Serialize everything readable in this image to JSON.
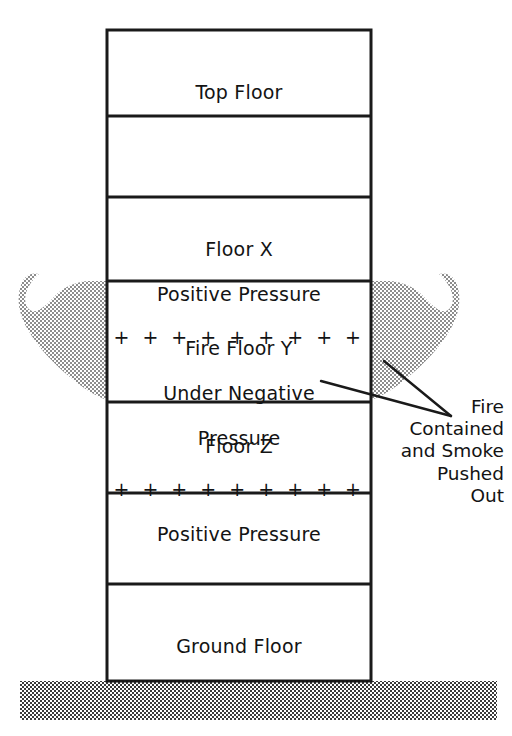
{
  "diagram": {
    "colors": {
      "line": "#1a1a1a",
      "text": "#131313",
      "background": "#ffffff",
      "smoke_fill": "#9a9a9a",
      "ground_fill": "#4d4d4d"
    }
  },
  "building": {
    "floors": [
      {
        "id": "top-floor",
        "lines": [
          "Top Floor"
        ],
        "has_plus_row": false,
        "plus_row_index": null
      },
      {
        "id": "blank-floor-upper",
        "lines": [],
        "has_plus_row": false,
        "plus_row_index": null
      },
      {
        "id": "floor-x",
        "lines": [
          "Floor X",
          "Positive Pressure"
        ],
        "has_plus_row": true,
        "plus_row_index": 2,
        "plus_signs": "+ + + + + + + + +",
        "plus_count": 9
      },
      {
        "id": "fire-floor-y",
        "lines": [
          "Fire Floor Y",
          "Under Negative",
          "Pressure"
        ],
        "has_plus_row": false,
        "plus_row_index": null
      },
      {
        "id": "floor-z",
        "lines": [
          "Floor Z",
          "Positive Pressure"
        ],
        "has_plus_row": true,
        "plus_row_index": 1,
        "plus_signs": "+ + + + + + + + +",
        "plus_count": 9
      },
      {
        "id": "blank-floor-lower",
        "lines": [],
        "has_plus_row": false,
        "plus_row_index": null
      },
      {
        "id": "ground-floor",
        "lines": [
          "Ground Floor"
        ],
        "has_plus_row": false,
        "plus_row_index": null
      }
    ]
  },
  "callout": {
    "lines": [
      "Fire",
      "Contained",
      "and Smoke",
      "Pushed",
      "Out"
    ]
  },
  "smoke": {
    "left_label": "smoke plume pushed out left side",
    "right_label": "smoke plume pushed out right side"
  },
  "ground": {
    "label": "ground"
  }
}
